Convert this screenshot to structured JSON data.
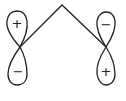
{
  "diagram": {
    "stroke_color": "#222222",
    "background": "#ffffff",
    "left_orbital": {
      "top_sign": "+",
      "bottom_sign": "−"
    },
    "right_orbital": {
      "top_sign": "−",
      "bottom_sign": "+"
    }
  }
}
